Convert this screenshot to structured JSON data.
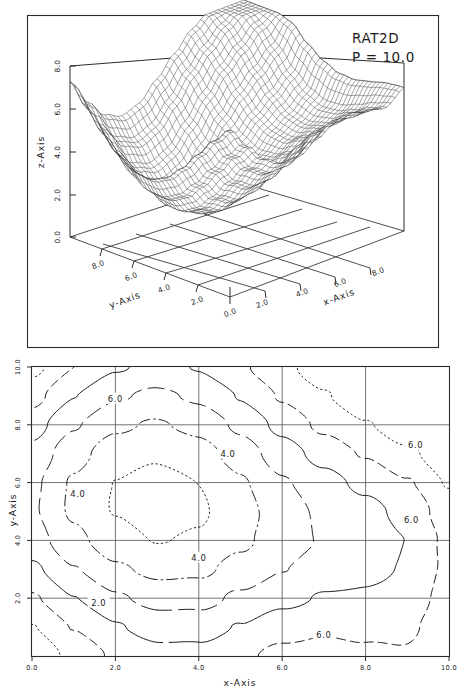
{
  "figure": {
    "title": "RAT2D",
    "parameter_label": "P = 10.0",
    "ink_color": "#1a1a1a",
    "background_color": "#ffffff"
  },
  "chart_data": [
    {
      "type": "surface",
      "title": "RAT2D",
      "annotation": "P = 10.0",
      "xlabel": "x-Axis",
      "ylabel": "y-Axis",
      "zlabel": "z-Axis",
      "xlim": [
        0.0,
        10.0
      ],
      "ylim": [
        0.0,
        10.0
      ],
      "zlim": [
        0.0,
        8.0
      ],
      "xticks": [
        "0.0",
        "2.0",
        "4.0",
        "6.0",
        "8.0"
      ],
      "yticks": [
        "2.0",
        "4.0",
        "6.0",
        "8.0"
      ],
      "zticks": [
        "0.0",
        "2.0",
        "4.0",
        "6.0",
        "8.0"
      ],
      "grid": false,
      "wireframe": true,
      "mesh_nx": 41,
      "mesh_ny": 41,
      "description": "Wireframe mesh surface, saddle/valley shaped with ridge running front-left to back, steep rise toward right-rear corner, drawn in black lines on white with projected base grid",
      "z_surface_rows": [
        [
          7.4,
          6.2,
          5.3,
          4.9,
          5.1,
          5.8,
          6.4,
          6.6,
          6.3,
          6.0,
          6.4
        ],
        [
          6.6,
          5.4,
          4.5,
          4.1,
          4.3,
          5.0,
          5.7,
          6.0,
          5.8,
          5.7,
          6.3
        ],
        [
          5.8,
          4.6,
          3.7,
          3.3,
          3.5,
          4.2,
          4.9,
          5.3,
          5.3,
          5.4,
          6.2
        ],
        [
          5.1,
          3.9,
          3.0,
          2.6,
          2.8,
          3.5,
          4.2,
          4.7,
          4.9,
          5.2,
          6.2
        ],
        [
          4.6,
          3.4,
          2.5,
          2.1,
          2.3,
          3.0,
          3.8,
          4.3,
          4.7,
          5.2,
          6.4
        ],
        [
          4.4,
          3.2,
          2.3,
          1.9,
          2.1,
          2.8,
          3.6,
          4.3,
          4.8,
          5.5,
          6.8
        ],
        [
          4.5,
          3.3,
          2.4,
          2.0,
          2.2,
          2.9,
          3.8,
          4.5,
          5.2,
          6.0,
          7.3
        ],
        [
          4.9,
          3.7,
          2.8,
          2.4,
          2.6,
          3.3,
          4.2,
          5.0,
          5.8,
          6.7,
          7.9
        ],
        [
          5.5,
          4.3,
          3.4,
          3.0,
          3.2,
          3.9,
          4.8,
          5.7,
          6.5,
          7.4,
          8.0
        ],
        [
          6.3,
          5.1,
          4.2,
          3.8,
          4.0,
          4.7,
          5.6,
          6.4,
          7.2,
          7.9,
          8.0
        ],
        [
          7.2,
          6.0,
          5.1,
          4.7,
          4.9,
          5.6,
          6.4,
          7.2,
          7.8,
          8.0,
          8.0
        ]
      ]
    },
    {
      "type": "contour",
      "xlabel": "x-Axis",
      "ylabel": "y-Axis",
      "xlim": [
        0.0,
        10.0
      ],
      "ylim": [
        0.0,
        10.0
      ],
      "xticks": [
        "0.0",
        "2.0",
        "4.0",
        "6.0",
        "8.0",
        "10.0"
      ],
      "yticks": [
        "2.0",
        "4.0",
        "6.0",
        "8.0",
        "10.0"
      ],
      "grid": true,
      "gridlines_x": [
        2.0,
        4.0,
        6.0,
        8.0
      ],
      "gridlines_y": [
        2.0,
        4.0,
        6.0,
        8.0
      ],
      "levels": [
        2.0,
        3.0,
        4.0,
        5.0,
        6.0,
        7.0
      ],
      "inline_labels": [
        {
          "text": "6.0",
          "x": 2.0,
          "y": 8.9
        },
        {
          "text": "4.0",
          "x": 4.7,
          "y": 7.0
        },
        {
          "text": "4.0",
          "x": 1.1,
          "y": 5.6
        },
        {
          "text": "4.0",
          "x": 4.0,
          "y": 3.4
        },
        {
          "text": "2.0",
          "x": 1.6,
          "y": 1.85
        },
        {
          "text": "6.0",
          "x": 9.2,
          "y": 7.3
        },
        {
          "text": "6.0",
          "x": 9.1,
          "y": 4.7
        },
        {
          "text": "6.0",
          "x": 7.0,
          "y": 0.75
        }
      ],
      "line_styles": [
        "solid",
        "dashed",
        "dotted",
        "dash-dot",
        "long-dash"
      ],
      "description": "Contour map of the same RAT2D surface; nested level curves with alternating solid, dashed, dotted and dash-dot styles, closed minima near lower-left and lower-centre, rising values toward right and upper edges"
    }
  ]
}
